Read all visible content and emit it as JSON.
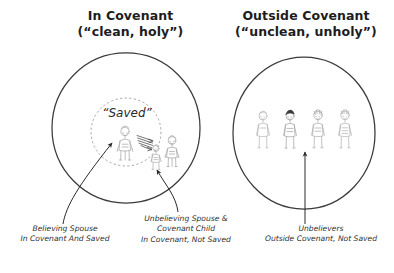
{
  "diagram": {
    "title_left": {
      "line1": "In Covenant",
      "line2": "(“clean, holy”)"
    },
    "title_right": {
      "line1": "Outside Covenant",
      "line2": "(“unclean, unholy”)"
    },
    "inner_circle_label": "“Saved”",
    "captions": {
      "believing_spouse": {
        "line1": "Believing Spouse",
        "line2": "In Covenant And Saved"
      },
      "unbelieving_spouse_child": {
        "line1": "Unbelieving Spouse &",
        "line2": "Covenant Child",
        "line3": "In Covenant, Not Saved"
      },
      "unbelievers": {
        "line1": "Unbelievers",
        "line2": "Outside Covenant, Not Saved"
      }
    },
    "colors": {
      "background": "#ffffff",
      "ink": "#2b2b2b",
      "circle_stroke": "#3a3a3a",
      "dashed_stroke": "#8a8a8a",
      "figure_stroke": "#a8a8a8",
      "figure_dark_hair": "#3a3a3a",
      "arrow": "#2b2b2b"
    },
    "shapes": {
      "left_circle": {
        "cx": 126,
        "cy": 128,
        "rx": 74,
        "ry": 75
      },
      "inner_dashed_circle": {
        "cx": 126,
        "cy": 132,
        "rx": 35,
        "ry": 34
      },
      "right_circle": {
        "cx": 304,
        "cy": 133,
        "rx": 71,
        "ry": 76
      }
    },
    "figures": {
      "left_saved_count": 1,
      "left_unsaved_count": 2,
      "right_count": 4
    }
  }
}
